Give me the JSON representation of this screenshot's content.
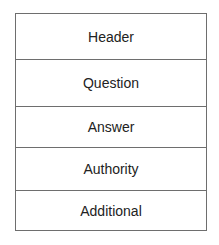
{
  "diagram": {
    "type": "stacked-boxes",
    "sections": [
      {
        "label": "Header"
      },
      {
        "label": "Question"
      },
      {
        "label": "Answer"
      },
      {
        "label": "Authority"
      },
      {
        "label": "Additional"
      }
    ]
  }
}
